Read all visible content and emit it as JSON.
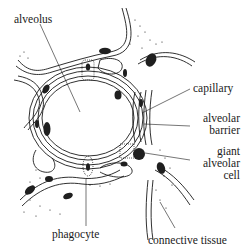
{
  "diagram": {
    "labels": {
      "alveolus": "alveolus",
      "capillary": "capillary",
      "alveolar_barrier_line1": "alveolar",
      "alveolar_barrier_line2": "barrier",
      "giant_cell_line1": "giant",
      "giant_cell_line2": "alveolar",
      "giant_cell_line3": "cell",
      "phagocyte": "phagocyte",
      "connective_tissue": "connective tissue"
    },
    "colors": {
      "ink": "#1a1a1a",
      "background": "#ffffff",
      "nucleus": "#1f1f1f"
    }
  }
}
